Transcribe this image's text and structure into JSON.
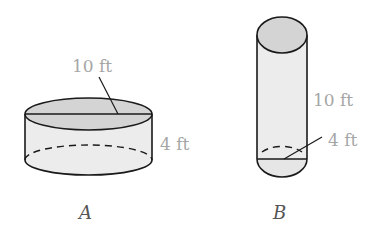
{
  "figure": {
    "cylinders": [
      {
        "id": "A",
        "label": "A",
        "diameter_label": "10 ft",
        "height_label": "4 ft",
        "diameter_ft": 10,
        "height_ft": 4
      },
      {
        "id": "B",
        "label": "B",
        "height_label": "10 ft",
        "diameter_label": "4 ft",
        "diameter_ft": 4,
        "height_ft": 10
      }
    ],
    "colors": {
      "stroke": "#1a1a1a",
      "top_fill": "#d4d4d4",
      "body_fill": "#ececec",
      "label_gray": "#a6a6a6"
    }
  }
}
